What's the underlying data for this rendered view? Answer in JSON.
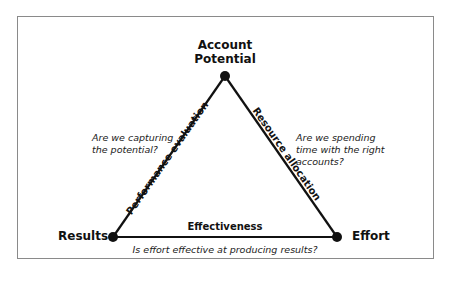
{
  "diagram": {
    "nodes": {
      "top": {
        "label_line1": "Account",
        "label_line2": "Potential"
      },
      "left": {
        "label": "Results"
      },
      "right": {
        "label": "Effort"
      }
    },
    "edges": {
      "left": {
        "label": "Performance evaluation",
        "question_line1": "Are we capturing",
        "question_line2": "the potential?"
      },
      "right": {
        "label": "Resource allocation",
        "question_line1": "Are we spending",
        "question_line2": "time with the right",
        "question_line3": "accounts?"
      },
      "bottom": {
        "label": "Effectiveness",
        "question": "Is effort effective at producing results?"
      }
    },
    "colors": {
      "line": "#111111",
      "border": "#8a8a8a",
      "background": "#ffffff"
    }
  }
}
